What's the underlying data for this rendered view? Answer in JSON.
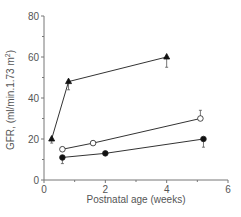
{
  "chart_data": {
    "type": "line",
    "title": "",
    "xlabel": "Postnatal age (weeks)",
    "ylabel": "GFR, (ml/min.1.73 m",
    "ylabel_sup": "2",
    "ylabel_close": ")",
    "xlim": [
      0,
      6
    ],
    "ylim": [
      0,
      80
    ],
    "xticks": [
      0,
      2,
      4,
      6
    ],
    "yticks": [
      0,
      20,
      40,
      60,
      80
    ],
    "grid": false,
    "legend": null,
    "series": [
      {
        "name": "triangle-filled",
        "marker": "triangle",
        "fill": "#111111",
        "points": [
          {
            "x": 0.25,
            "y": 20,
            "err_lo": 18,
            "err_hi": 20
          },
          {
            "x": 0.8,
            "y": 48,
            "err_lo": 44,
            "err_hi": 48
          },
          {
            "x": 4.0,
            "y": 60,
            "err_lo": 55,
            "err_hi": 60
          }
        ]
      },
      {
        "name": "circle-open",
        "marker": "circle",
        "fill": "#ffffff",
        "points": [
          {
            "x": 0.6,
            "y": 15,
            "err_lo": 15,
            "err_hi": 16
          },
          {
            "x": 1.6,
            "y": 18,
            "err_lo": 18,
            "err_hi": 19
          },
          {
            "x": 5.1,
            "y": 30,
            "err_lo": 30,
            "err_hi": 34
          }
        ]
      },
      {
        "name": "circle-filled",
        "marker": "circle",
        "fill": "#111111",
        "points": [
          {
            "x": 0.6,
            "y": 11,
            "err_lo": 8,
            "err_hi": 11
          },
          {
            "x": 2.0,
            "y": 13,
            "err_lo": 12,
            "err_hi": 13
          },
          {
            "x": 5.2,
            "y": 20,
            "err_lo": 16,
            "err_hi": 20
          }
        ]
      }
    ]
  }
}
